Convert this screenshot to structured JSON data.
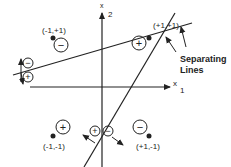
{
  "axes": {
    "x1_label": "x",
    "x1_sub": "1",
    "x2_label": "x",
    "x2_sub": "2"
  },
  "points": [
    {
      "label": "(-1,+1)",
      "class_sign": "−"
    },
    {
      "label": "(+1,+1)",
      "class_sign": "+"
    },
    {
      "label": "(-1,-1)",
      "class_sign": "+"
    },
    {
      "label": "(+1,-1)",
      "class_sign": "−"
    }
  ],
  "line_signs": {
    "line1_top": "−",
    "line1_bottom": "+",
    "line2_left": "+",
    "line2_right": "−"
  },
  "annotation": {
    "line1": "Separating",
    "line2": "Lines"
  },
  "colors": {
    "stroke": "#222222",
    "background": "#ffffff"
  }
}
